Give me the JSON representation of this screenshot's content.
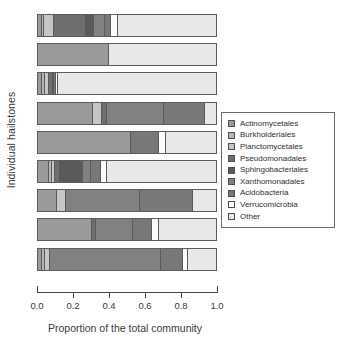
{
  "chart_data": {
    "type": "bar",
    "orientation": "horizontal",
    "stacked": true,
    "title": "",
    "xlabel": "Proportion of the total community",
    "ylabel": "Individual hailstones",
    "xlim": [
      0,
      1
    ],
    "xticks": [
      "0.0",
      "0.2",
      "0.4",
      "0.6",
      "0.8",
      "1.0"
    ],
    "xtick_values": [
      0.0,
      0.2,
      0.4,
      0.6,
      0.8,
      1.0
    ],
    "grid": false,
    "legend_position": "right",
    "categories": [
      "Hailstone 1",
      "Hailstone 2",
      "Hailstone 3",
      "Hailstone 4",
      "Hailstone 5",
      "Hailstone 6",
      "Hailstone 7",
      "Hailstone 8",
      "Hailstone 9"
    ],
    "series": [
      {
        "name": "Actinomycetales",
        "color": "#9a9a9a",
        "values": [
          0.02,
          0.4,
          0.022,
          0.31,
          0.52,
          0.06,
          0.105,
          0.305,
          0.025
        ]
      },
      {
        "name": "Burkholderiales",
        "color": "#b4b4b4",
        "values": [
          0.012,
          0.0,
          0.02,
          0.0,
          0.0,
          0.02,
          0.0,
          0.0,
          0.012
        ]
      },
      {
        "name": "Planctomycetales",
        "color": "#c6c6c6",
        "values": [
          0.055,
          0.0,
          0.018,
          0.05,
          0.0,
          0.015,
          0.05,
          0.0,
          0.03
        ]
      },
      {
        "name": "Pseudomonadales",
        "color": "#6e6e6e",
        "values": [
          0.18,
          0.0,
          0.022,
          0.03,
          0.0,
          0.03,
          0.0,
          0.02,
          0.0
        ]
      },
      {
        "name": "Sphingobacteriales",
        "color": "#5a5a5a",
        "values": [
          0.05,
          0.0,
          0.0,
          0.0,
          0.0,
          0.125,
          0.0,
          0.0,
          0.0
        ]
      },
      {
        "name": "Xanthomonadales",
        "color": "#818181",
        "values": [
          0.06,
          0.0,
          0.01,
          0.32,
          0.0,
          0.045,
          0.42,
          0.21,
          0.625
        ]
      },
      {
        "name": "Acidobacteria",
        "color": "#787878",
        "values": [
          0.035,
          0.0,
          0.01,
          0.23,
          0.16,
          0.06,
          0.295,
          0.105,
          0.125
        ]
      },
      {
        "name": "Verrucomicrobia",
        "color": "#fcfcfc",
        "values": [
          0.035,
          0.0,
          0.008,
          0.0,
          0.04,
          0.03,
          0.0,
          0.04,
          0.028
        ]
      },
      {
        "name": "Other",
        "color": "#e8e8e8",
        "values": [
          0.553,
          0.6,
          0.89,
          0.06,
          0.28,
          0.615,
          0.13,
          0.32,
          0.155
        ]
      }
    ]
  },
  "legend": {
    "items": [
      {
        "label": "Actinomycetales"
      },
      {
        "label": "Burkholderiales"
      },
      {
        "label": "Planctomycetales"
      },
      {
        "label": "Pseudomonadales"
      },
      {
        "label": "Sphingobacteriales"
      },
      {
        "label": "Xanthomonadales"
      },
      {
        "label": "Acidobacteria"
      },
      {
        "label": "Verrucomicrobia"
      },
      {
        "label": "Other"
      }
    ]
  }
}
